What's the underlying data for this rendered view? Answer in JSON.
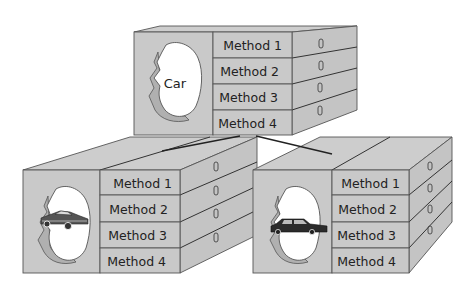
{
  "diagram": {
    "type": "object inheritance / class diagram (3D boxes)",
    "parent": {
      "label": "Car",
      "methods": [
        "Method 1",
        "Method 2",
        "Method 3",
        "Method 4"
      ],
      "handle_glyph": "drawer-handle"
    },
    "children": [
      {
        "name": "sports-car",
        "image": "sports-car-icon",
        "methods": [
          "Method 1",
          "Method 2",
          "Method 3",
          "Method 4"
        ]
      },
      {
        "name": "limousine",
        "image": "limousine-icon",
        "methods": [
          "Method 1",
          "Method 2",
          "Method 3",
          "Method 4"
        ]
      }
    ],
    "colors": {
      "box_fill": "#c9c9c9",
      "outline": "#555555",
      "background": "#ffffff"
    }
  }
}
